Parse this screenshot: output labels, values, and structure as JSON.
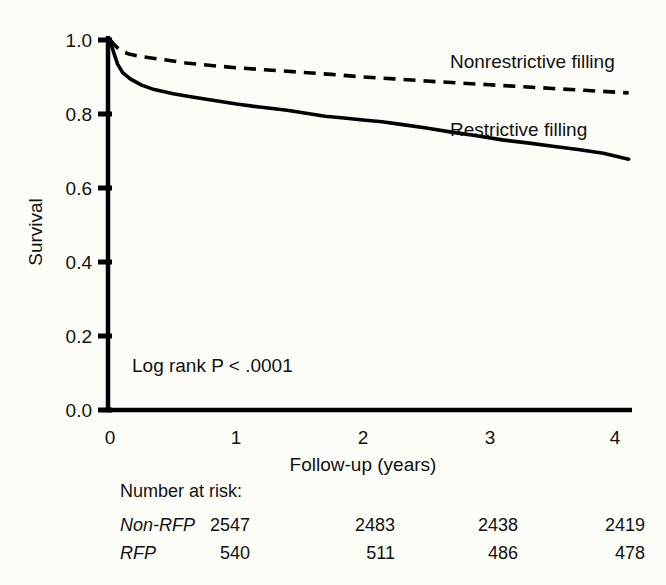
{
  "chart_data": {
    "type": "line",
    "title": "",
    "xlabel": "Follow-up (years)",
    "ylabel": "Survival",
    "xlim": [
      0,
      4.15
    ],
    "ylim": [
      0.0,
      1.0
    ],
    "xticks": [
      "0",
      "1",
      "2",
      "3",
      "4"
    ],
    "xtick_values": [
      0,
      1,
      2,
      3,
      4
    ],
    "yticks": [
      "0.0",
      "0.2",
      "0.4",
      "0.6",
      "0.8",
      "1.0"
    ],
    "ytick_values": [
      0.0,
      0.2,
      0.4,
      0.6,
      0.8,
      1.0
    ],
    "grid": false,
    "legend_position": "inline-right",
    "annotation": "Log rank P < .0001",
    "series": [
      {
        "name": "Nonrestrictive filling",
        "style": "dashed",
        "x": [
          0,
          0.04,
          0.08,
          0.15,
          0.25,
          0.4,
          0.6,
          0.8,
          1.0,
          1.25,
          1.5,
          1.75,
          2.0,
          2.25,
          2.5,
          2.75,
          3.0,
          3.25,
          3.5,
          3.75,
          4.0,
          4.1
        ],
        "values": [
          1.0,
          0.985,
          0.972,
          0.962,
          0.955,
          0.948,
          0.938,
          0.931,
          0.925,
          0.919,
          0.913,
          0.907,
          0.9,
          0.895,
          0.889,
          0.884,
          0.879,
          0.874,
          0.869,
          0.864,
          0.859,
          0.857
        ]
      },
      {
        "name": "Restrictive filling",
        "style": "solid",
        "x": [
          0,
          0.03,
          0.06,
          0.1,
          0.16,
          0.25,
          0.35,
          0.5,
          0.65,
          0.8,
          1.0,
          1.2,
          1.4,
          1.55,
          1.7,
          1.85,
          2.0,
          2.15,
          2.3,
          2.5,
          2.7,
          2.9,
          3.1,
          3.3,
          3.5,
          3.7,
          3.9,
          4.05,
          4.1
        ],
        "values": [
          1.0,
          0.965,
          0.935,
          0.912,
          0.895,
          0.878,
          0.866,
          0.855,
          0.846,
          0.838,
          0.827,
          0.818,
          0.81,
          0.802,
          0.794,
          0.789,
          0.784,
          0.779,
          0.772,
          0.762,
          0.751,
          0.741,
          0.73,
          0.722,
          0.713,
          0.704,
          0.694,
          0.682,
          0.678
        ]
      }
    ]
  },
  "risk_table": {
    "heading": "Number at risk:",
    "row_labels": [
      "Non-RFP",
      "RFP"
    ],
    "columns": [
      "0",
      "1",
      "2",
      "3",
      "4"
    ],
    "rows": [
      {
        "label": "Non-RFP",
        "values": [
          "2547",
          "2483",
          "2438",
          "2419"
        ]
      },
      {
        "label": "RFP",
        "values": [
          "540",
          "511",
          "486",
          "478"
        ]
      }
    ]
  },
  "colors": {
    "ink": "#000000",
    "background": "#fdfdf8",
    "text": "#111111"
  }
}
